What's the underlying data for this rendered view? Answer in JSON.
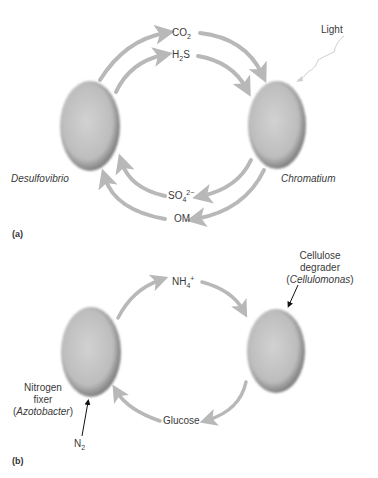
{
  "panel_a": {
    "label": "(a)",
    "light_label": "Light",
    "organisms": {
      "left": "Desulfovibrio",
      "right": "Chromatium"
    },
    "top_flows": [
      {
        "base": "CO",
        "sub": "2"
      },
      {
        "base": "H",
        "sub": "2",
        "tail": "S"
      }
    ],
    "bottom_flows": [
      {
        "base": "SO",
        "sub": "4",
        "sup": "2−"
      },
      {
        "base": "OM"
      }
    ]
  },
  "panel_b": {
    "label": "(b)",
    "top_flow": {
      "base": "NH",
      "sub": "4",
      "sup": "+"
    },
    "bottom_flow": "Glucose",
    "right_organism": {
      "line1": "Cellulose",
      "line2": "degrader",
      "italic": "Cellulomonas"
    },
    "left_organism": {
      "line1": "Nitrogen",
      "line2": "fixer",
      "italic": "Azotobacter"
    },
    "input": {
      "base": "N",
      "sub": "2"
    }
  },
  "colors": {
    "arrow": "#b8b8b8",
    "cell_rim": "#7a7a7a",
    "cell_fill": "#bdbdbd",
    "text": "#333333"
  }
}
